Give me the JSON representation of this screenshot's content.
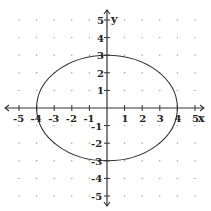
{
  "chart_data": {
    "type": "line",
    "title": "",
    "xlabel": "x",
    "ylabel": "y",
    "xlim": [
      -5,
      5
    ],
    "ylim": [
      -5,
      5
    ],
    "grid": "dots",
    "x_ticks": [
      "-5",
      "-4",
      "-3",
      "-2",
      "-1",
      "1",
      "2",
      "3",
      "4",
      "5"
    ],
    "y_ticks": [
      "5",
      "4",
      "3",
      "2",
      "1",
      "-1",
      "-2",
      "-3",
      "-4",
      "-5"
    ],
    "series": [
      {
        "name": "ellipse",
        "equation": "x^2/16 + y^2/9 = 1",
        "center": [
          0,
          0
        ],
        "semi_major_x": 4,
        "semi_minor_y": 3,
        "key_points": [
          [
            4,
            0
          ],
          [
            0,
            3
          ],
          [
            -4,
            0
          ],
          [
            0,
            -3
          ]
        ]
      }
    ]
  },
  "axes": {
    "x_label": "x",
    "y_label": "y"
  },
  "colors": {
    "axis": "#333333",
    "curve": "#333333",
    "grid_dot": "#999999"
  }
}
